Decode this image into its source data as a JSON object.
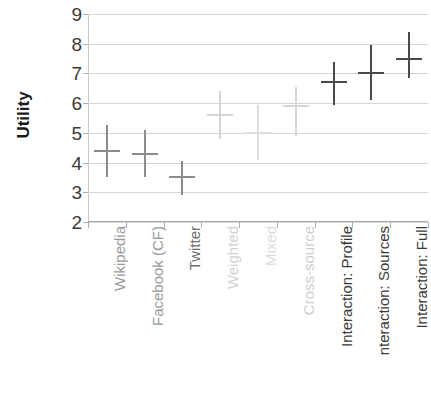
{
  "chart_data": {
    "type": "scatter",
    "title": "",
    "xlabel": "",
    "ylabel": "Utility",
    "ylim": [
      2,
      9
    ],
    "yticks": [
      9,
      8,
      7,
      6,
      5,
      4,
      3,
      2
    ],
    "grid": true,
    "legend": "none",
    "categories": [
      "Wikipedia",
      "Facebook (CF)",
      "Twitter",
      "Weighted",
      "Mixed",
      "Cross-source",
      "Interaction: Profile",
      "nteraction: Sources",
      "Interaction: Full"
    ],
    "values": [
      4.4,
      4.3,
      3.5,
      5.6,
      5.0,
      5.9,
      6.7,
      7.0,
      7.5
    ],
    "error_low": [
      3.5,
      3.5,
      2.9,
      4.8,
      4.1,
      4.9,
      5.95,
      6.1,
      6.85
    ],
    "error_high": [
      5.25,
      5.1,
      4.05,
      6.4,
      5.95,
      6.55,
      7.4,
      7.95,
      8.4
    ],
    "point_colors": [
      "#8c8c8c",
      "#8c8c8c",
      "#8c8c8c",
      "#d4d4d4",
      "#dedede",
      "#d8d8d8",
      "#4a4a4a",
      "#4a4a4a",
      "#4a4a4a"
    ],
    "label_colors": [
      "#9a9a9a",
      "#9a9a9a",
      "#6e6e6e",
      "#d2d2d2",
      "#dcdcdc",
      "#cfcfcf",
      "#3a3a3a",
      "#3a3a3a",
      "#3a3a3a"
    ]
  },
  "axis": {
    "y_title": "Utility",
    "y_tick_labels": [
      "9",
      "8",
      "7",
      "6",
      "5",
      "4",
      "3",
      "2"
    ]
  },
  "colors": {
    "gridline": "#d6d6d6",
    "axis": "#a8a8a8",
    "dark_series": "#4a4a4a",
    "mid_series": "#8c8c8c",
    "light_series": "#d8d8d8",
    "background": "#ffffff"
  }
}
